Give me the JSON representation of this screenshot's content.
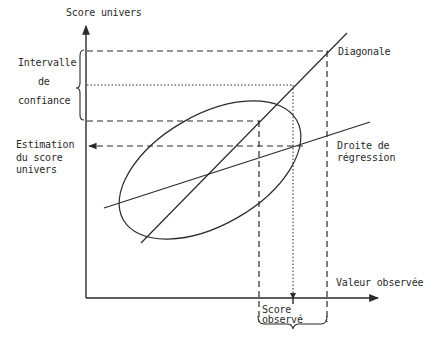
{
  "diagram": {
    "type": "scatter-ellipse-regression",
    "axes": {
      "y_label": "Score univers",
      "x_label": "Valeur observée"
    },
    "lines": {
      "diagonal_label": "Diagonale",
      "regression_label_line1": "Droite de",
      "regression_label_line2": "régression"
    },
    "left_annotations": {
      "interval_line1": "Intervalle",
      "interval_line2": "de",
      "interval_line3": "confiance",
      "estimate_line1": "Estimation",
      "estimate_line2": "du score",
      "estimate_line3": "univers"
    },
    "bottom_annotations": {
      "observed_line1": "Score",
      "observed_line2": "observé"
    },
    "colors": {
      "ink": "#2a2a2a",
      "background": "#ffffff"
    }
  }
}
